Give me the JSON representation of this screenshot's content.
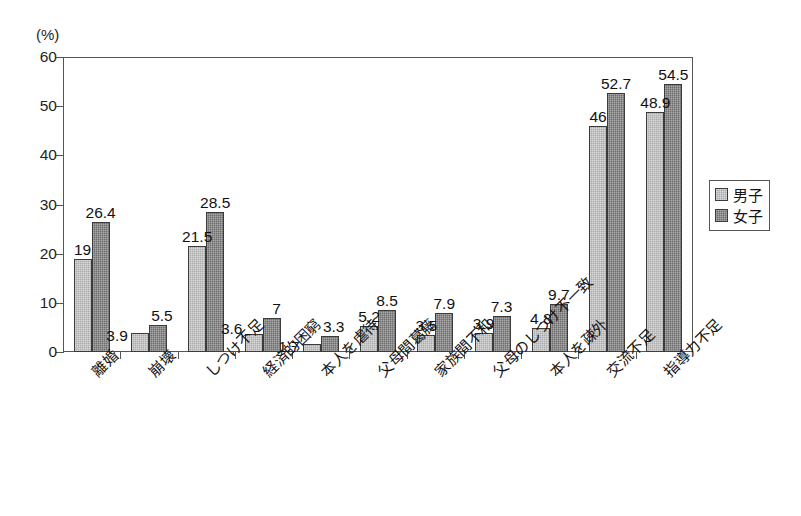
{
  "chart_data": {
    "type": "bar",
    "title": "",
    "subtitle": "",
    "xlabel": "",
    "ylabel": "(%)",
    "ylim": [
      0,
      60
    ],
    "ytick_labels": [
      "0",
      "10",
      "20",
      "30",
      "40",
      "50",
      "60"
    ],
    "ytick_values": [
      0,
      10,
      20,
      30,
      40,
      50,
      60
    ],
    "grid": false,
    "legend_position": "right",
    "categories": [
      "離婚",
      "崩壊",
      "しつけ不足",
      "経済的困窮",
      "本人を虐待",
      "父母間葛藤",
      "家族間不和",
      "父母のしつけ不一致",
      "本人を疎外",
      "交流不足",
      "指導力不足"
    ],
    "series": [
      {
        "name": "男子",
        "color": "#ababab",
        "values": [
          19,
          3.9,
          21.5,
          3.6,
          1.7,
          5.2,
          3.5,
          3.9,
          4.8,
          46,
          48.9
        ],
        "value_labels": [
          "19",
          "3.9",
          "21.5",
          "3.6",
          "1.7",
          "5.2",
          "3.5",
          "3.9",
          "4.8",
          "46",
          "48.9"
        ]
      },
      {
        "name": "女子",
        "color": "#6d6d6d",
        "values": [
          26.4,
          5.5,
          28.5,
          7,
          3.3,
          8.5,
          7.9,
          7.3,
          9.7,
          52.7,
          54.5
        ],
        "value_labels": [
          "26.4",
          "5.5",
          "28.5",
          "7",
          "3.3",
          "8.5",
          "7.9",
          "7.3",
          "9.7",
          "52.7",
          "54.5"
        ]
      }
    ]
  },
  "legend": {
    "entries": [
      {
        "label": "男子",
        "swatch": "boys"
      },
      {
        "label": "女子",
        "swatch": "girls"
      }
    ]
  },
  "axis": {
    "unit_label": "(%)"
  }
}
